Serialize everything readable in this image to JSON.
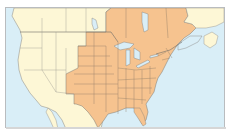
{
  "map": {
    "title": "",
    "region": "North America (United States and southern Canada)",
    "colors": {
      "water": "#d9eef7",
      "unhighlighted_land": "#fdf7d6",
      "highlighted_land": "#f6c38f",
      "borders": "#7d7a74",
      "frame": "#b9bcbf"
    },
    "highlighted_regions": [
      "North Dakota",
      "South Dakota",
      "Nebraska",
      "Kansas",
      "Oklahoma",
      "Texas",
      "Colorado",
      "New Mexico",
      "Minnesota",
      "Iowa",
      "Missouri",
      "Arkansas",
      "Louisiana",
      "Wisconsin",
      "Illinois",
      "Michigan",
      "Indiana",
      "Ohio",
      "Kentucky",
      "Tennessee",
      "Mississippi",
      "Alabama",
      "Georgia",
      "Florida",
      "South Carolina",
      "North Carolina",
      "Virginia",
      "West Virginia",
      "Maryland",
      "Delaware",
      "Pennsylvania",
      "New Jersey",
      "New York",
      "Connecticut",
      "Rhode Island",
      "Massachusetts",
      "Vermont",
      "New Hampshire",
      "Maine",
      "Ontario",
      "Quebec",
      "New Brunswick",
      "Nova Scotia",
      "Prince Edward Island"
    ],
    "unhighlighted_regions": [
      "Washington",
      "Oregon",
      "California",
      "Nevada",
      "Idaho",
      "Montana",
      "Wyoming",
      "Utah",
      "Arizona",
      "British Columbia",
      "Alberta",
      "Saskatchewan",
      "Manitoba",
      "Newfoundland",
      "Mexico"
    ]
  }
}
